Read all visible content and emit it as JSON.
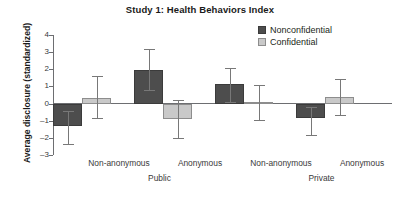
{
  "chart_data": {
    "type": "bar",
    "title": "Study 1: Health Behaviors Index",
    "xlabel": "",
    "ylabel": "Average disclosure (standardized)",
    "ylim": [
      -3,
      4
    ],
    "yticks": [
      4,
      3,
      2,
      1,
      0,
      -1,
      -2,
      -3
    ],
    "ytick_labels": [
      "4",
      "3",
      "2",
      "1",
      "0",
      "–1",
      "–2",
      "–3"
    ],
    "grid": false,
    "legend_position": "top-right",
    "categories": [
      "Non-anonymous",
      "Anonymous",
      "Non-anonymous",
      "Anonymous"
    ],
    "group_labels": [
      "Public",
      "Private"
    ],
    "series": [
      {
        "name": "Nonconfidential",
        "color": "#4d4d4d",
        "values": [
          -1.3,
          1.98,
          1.12,
          -0.85
        ],
        "err_upper": [
          -0.42,
          3.2,
          2.1,
          -0.22
        ],
        "err_lower": [
          -2.38,
          0.78,
          0.1,
          -1.85
        ]
      },
      {
        "name": "Confidential",
        "color": "#c9c9c9",
        "values": [
          0.35,
          -0.9,
          0.1,
          0.4
        ],
        "err_upper": [
          1.62,
          0.18,
          1.1,
          1.42
        ],
        "err_lower": [
          -0.82,
          -1.98,
          -0.98,
          -0.66
        ]
      }
    ],
    "legend": [
      "Nonconfidential",
      "Confidential"
    ]
  },
  "legend": {
    "items": [
      {
        "label": "Nonconfidential"
      },
      {
        "label": "Confidential"
      }
    ]
  },
  "axes": {
    "y_title": "Average disclosure (standardized)",
    "y_tick_labels": [
      "4",
      "3",
      "2",
      "1",
      "0",
      "–1",
      "–2",
      "–3"
    ],
    "x_tick_labels": [
      "Non-anonymous",
      "Anonymous",
      "Non-anonymous",
      "Anonymous"
    ],
    "x_group_labels": [
      "Public",
      "Private"
    ]
  },
  "header": {
    "title": "Study 1: Health Behaviors Index"
  }
}
